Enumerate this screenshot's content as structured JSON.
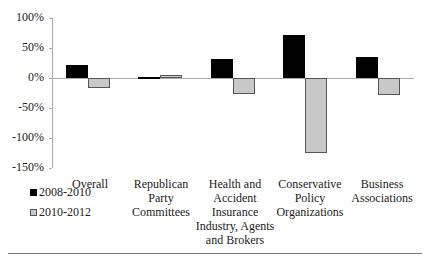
{
  "chart_data": {
    "type": "bar",
    "title": "",
    "xlabel": "",
    "ylabel": "",
    "ylim": [
      -150,
      100
    ],
    "yticks": [
      "100%",
      "50%",
      "0%",
      "-50%",
      "-100%",
      "-150%"
    ],
    "grid": false,
    "legend_position": "bottom-left",
    "categories": [
      "Overall",
      "Republican Party Committees",
      "Health and Accident Insurance Industry, Agents and Brokers",
      "Conservative Policy Organizations",
      "Business Associations"
    ],
    "series": [
      {
        "name": "2008-2010",
        "color": "#000000",
        "values": [
          22,
          1,
          32,
          72,
          35
        ]
      },
      {
        "name": "2010-2012",
        "color": "#c8c8c8",
        "values": [
          -17,
          5,
          -27,
          -125,
          -28
        ]
      }
    ]
  },
  "axis": {
    "y_ticks": [
      "100%",
      "50%",
      "0%",
      "-50%",
      "-100%",
      "-150%"
    ]
  },
  "categories": {
    "c0": [
      "Overall"
    ],
    "c1": [
      "Republican",
      "Party",
      "Committees"
    ],
    "c2": [
      "Health and",
      "Accident",
      "Insurance",
      "Industry, Agents",
      "and Brokers"
    ],
    "c3": [
      "Conservative",
      "Policy",
      "Organizations"
    ],
    "c4": [
      "Business",
      "Associations"
    ]
  },
  "legend": {
    "s0": "2008-2010",
    "s1": "2010-2012"
  }
}
